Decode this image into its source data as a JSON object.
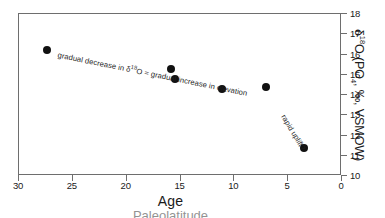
{
  "chart_data": {
    "type": "scatter",
    "title": "",
    "xlabel": "Age",
    "ylabel": "δ18O (PO4, ‰, VSMOW)",
    "ylabel_parts": {
      "delta": "δ",
      "iso": "18",
      "o": "O",
      "paren_open": " (PO",
      "po4_sub": "4",
      "rest": ", ‰, VSMOW)"
    },
    "xlim": [
      30,
      0
    ],
    "ylim": [
      10,
      18
    ],
    "x_reversed": true,
    "grid": false,
    "legend": "none",
    "xticks": [
      30,
      25,
      20,
      15,
      10,
      5,
      0
    ],
    "yticks": [
      10,
      11,
      12,
      13,
      14,
      15,
      16,
      17,
      18
    ],
    "x": [
      27.4,
      15.9,
      15.5,
      11.1,
      7.1,
      3.5
    ],
    "y": [
      16.2,
      15.3,
      14.8,
      14.3,
      14.4,
      11.4
    ],
    "points": [
      {
        "x": 27.4,
        "y": 16.2
      },
      {
        "x": 15.9,
        "y": 15.3
      },
      {
        "x": 15.5,
        "y": 14.8
      },
      {
        "x": 11.1,
        "y": 14.3
      },
      {
        "x": 7.1,
        "y": 14.4
      },
      {
        "x": 3.5,
        "y": 11.4
      }
    ],
    "marker": {
      "shape": "circle",
      "color": "#111111",
      "size": 8
    },
    "annotations": [
      {
        "name": "gradual-trend-note",
        "text_plain": "gradual decrease in δ18O = gradual increase in elevation",
        "prefix": "gradual decrease in δ",
        "superscript": "18",
        "suffix": "O = gradual increase in elevation",
        "rotation_deg": 11.5
      },
      {
        "name": "rapid-uplift-note",
        "text_plain": "rapid uplift?",
        "rotation_deg": 59
      }
    ],
    "sub_caption": "Paleolatitude"
  },
  "axes": {
    "x_title": "Age",
    "x_tick_labels": [
      "30",
      "25",
      "20",
      "15",
      "10",
      "5",
      "0"
    ],
    "y_tick_labels": [
      "10",
      "11",
      "12",
      "13",
      "14",
      "15",
      "16",
      "17",
      "18"
    ]
  },
  "colors": {
    "frame": "#6e6e6e",
    "marker": "#111111",
    "text": "#1a1a1a",
    "background": "#ffffff"
  }
}
